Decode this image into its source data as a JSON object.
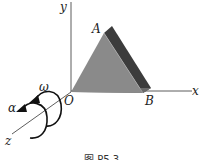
{
  "figure": {
    "axes": {
      "x": "x",
      "y": "y",
      "z": "z",
      "origin": "O"
    },
    "points": {
      "A": "A",
      "B": "B"
    },
    "rotation": {
      "omega": "ω",
      "alpha": "α"
    },
    "caption": "图 P5.3",
    "colors": {
      "front_face": "#8a8a8a",
      "side_face": "#3c3c3c",
      "bottom_edge": "#6a6a6a",
      "axis": "#333333"
    }
  }
}
